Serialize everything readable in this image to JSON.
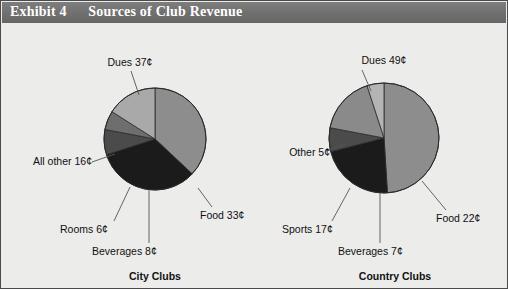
{
  "header": {
    "exhibit_label": "Exhibit 4",
    "title": "Sources of Club Revenue"
  },
  "colors": {
    "header_bg": "#737373",
    "header_text": "#ffffff",
    "page_bg": "#ececeb",
    "border": "#4a4a4a",
    "leader_line": "#555555",
    "slice_dues": "#8d8d8d",
    "slice_food": "#1b1b1b",
    "slice_beverages": "#4b4b4b",
    "slice_rooms": "#6e6e6e",
    "slice_allother": "#a9a9a9",
    "slice_sports": "#8a8a8a",
    "slice_other": "#b4b4b4",
    "slice_outline": "#2a2a2a"
  },
  "chart_data": [
    {
      "type": "pie",
      "name": "city-clubs",
      "title": "City Clubs",
      "unit": "¢",
      "total": 100,
      "categories": [
        "Dues",
        "Food",
        "Beverages",
        "Rooms",
        "All other"
      ],
      "values": [
        37,
        33,
        8,
        6,
        16
      ],
      "labels": [
        "Dues 37¢",
        "Food 33¢",
        "Beverages 8¢",
        "Rooms 6¢",
        "All other 16¢"
      ],
      "slice_colors": [
        "#8d8d8d",
        "#1b1b1b",
        "#4b4b4b",
        "#6e6e6e",
        "#a9a9a9"
      ],
      "start_angle": 0,
      "direction": "clockwise"
    },
    {
      "type": "pie",
      "name": "country-clubs",
      "title": "Country Clubs",
      "unit": "¢",
      "total": 100,
      "categories": [
        "Dues",
        "Food",
        "Beverages",
        "Sports",
        "Other"
      ],
      "values": [
        49,
        22,
        7,
        17,
        5
      ],
      "labels": [
        "Dues 49¢",
        "Food 22¢",
        "Beverages 7¢",
        "Sports 17¢",
        "Other 5¢"
      ],
      "slice_colors": [
        "#8d8d8d",
        "#1b1b1b",
        "#4b4b4b",
        "#8a8a8a",
        "#b4b4b4"
      ],
      "start_angle": 0,
      "direction": "clockwise"
    }
  ],
  "city": {
    "caption": "City Clubs",
    "callouts": {
      "dues": "Dues 37¢",
      "food": "Food 33¢",
      "beverages": "Beverages 8¢",
      "rooms": "Rooms 6¢",
      "allother": "All other 16¢"
    }
  },
  "country": {
    "caption": "Country Clubs",
    "callouts": {
      "dues": "Dues 49¢",
      "food": "Food 22¢",
      "beverages": "Beverages 7¢",
      "sports": "Sports 17¢",
      "other": "Other 5¢"
    }
  }
}
